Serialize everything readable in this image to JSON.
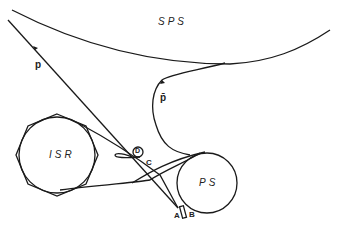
{
  "diagram": {
    "title_fragment": "",
    "labels": {
      "sps": "SPS",
      "isr": "ISR",
      "ps": "PS",
      "proton": "p",
      "antiproton": "p̄",
      "d": "D",
      "c": "C",
      "a": "A",
      "b": "B"
    },
    "colors": {
      "line": "#1a1a1a",
      "background": "#ffffff",
      "text": "#222222"
    }
  }
}
